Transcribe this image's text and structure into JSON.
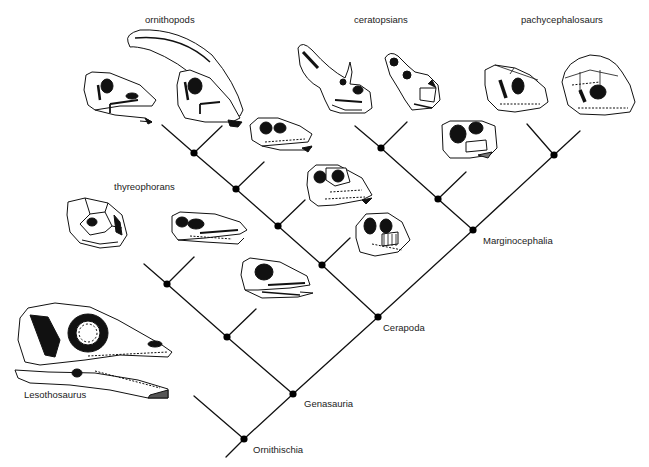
{
  "figure": {
    "type": "cladogram",
    "line_color": "#111111",
    "node_color": "#000000"
  },
  "group_labels": {
    "ornithopods": "ornithopods",
    "ceratopsians": "ceratopsians",
    "pachycephalosaurs": "pachycephalosaurs",
    "thyreophorans": "thyreophorans"
  },
  "clade_labels": {
    "ornithischia": "Ornithischia",
    "genasauria": "Genasauria",
    "cerapoda": "Cerapoda",
    "marginocephalia": "Marginocephalia"
  },
  "taxon_labels": {
    "lesothosaurus": "Lesothosaurus"
  },
  "tree": {
    "nodes": [
      {
        "id": "ornithischia",
        "x": 244,
        "y": 439,
        "label": "Ornithischia"
      },
      {
        "id": "genasauria",
        "x": 293,
        "y": 394,
        "label": "Genasauria"
      },
      {
        "id": "cerapoda",
        "x": 378,
        "y": 317,
        "label": "Cerapoda"
      },
      {
        "id": "marginocephalia",
        "x": 473,
        "y": 230,
        "label": "Marginocephalia"
      },
      {
        "id": "thyreophora-1",
        "x": 227,
        "y": 337
      },
      {
        "id": "thyreophora-2",
        "x": 167,
        "y": 284
      },
      {
        "id": "ornithopoda-1",
        "x": 322,
        "y": 265
      },
      {
        "id": "ornithopoda-2",
        "x": 278,
        "y": 226
      },
      {
        "id": "ornithopoda-3",
        "x": 236,
        "y": 189
      },
      {
        "id": "ornithopoda-4",
        "x": 194,
        "y": 153
      },
      {
        "id": "ceratopsia-1",
        "x": 438,
        "y": 199
      },
      {
        "id": "ceratopsia-2",
        "x": 381,
        "y": 148
      },
      {
        "id": "pachycephalosauria",
        "x": 554,
        "y": 155
      }
    ],
    "terminal_skulls": [
      {
        "name": "lesothosaurus-skull",
        "group": "basal"
      },
      {
        "name": "thyreophoran-skull-armored",
        "group": "thyreophorans"
      },
      {
        "name": "thyreophoran-skull-2",
        "group": "thyreophorans"
      },
      {
        "name": "thyreophoran-skull-3",
        "group": "thyreophorans"
      },
      {
        "name": "ornithopod-skull-1",
        "group": "ornithopods"
      },
      {
        "name": "ornithopod-skull-crested",
        "group": "ornithopods"
      },
      {
        "name": "ornithopod-skull-3",
        "group": "ornithopods"
      },
      {
        "name": "ornithopod-skull-4",
        "group": "ornithopods"
      },
      {
        "name": "ornithopod-skull-5",
        "group": "ornithopods"
      },
      {
        "name": "ceratopsian-skull-horned",
        "group": "ceratopsians"
      },
      {
        "name": "ceratopsian-skull-frilled",
        "group": "ceratopsians"
      },
      {
        "name": "ceratopsian-skull-basal",
        "group": "ceratopsians"
      },
      {
        "name": "pachycephalosaur-skull-flat",
        "group": "pachycephalosaurs"
      },
      {
        "name": "pachycephalosaur-skull-domed",
        "group": "pachycephalosaurs"
      }
    ]
  }
}
